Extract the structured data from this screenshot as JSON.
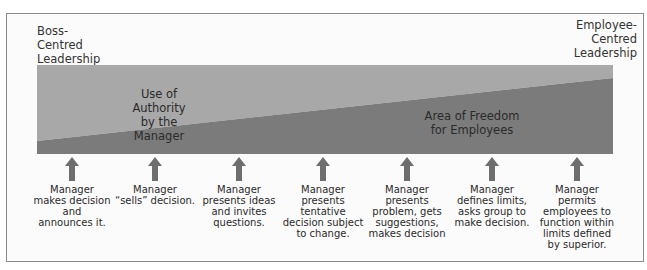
{
  "diagram": {
    "type": "leadership-continuum",
    "left_end_label": "Boss-\nCentred\nLeadership",
    "left_end_lines": [
      "Boss-",
      "Centred",
      "Leadership"
    ],
    "right_end_lines": [
      "Employee-",
      "Centred",
      "Leadership"
    ],
    "regions": {
      "authority": {
        "lines": [
          "Use of Authority",
          "by the Manager"
        ],
        "color": "#a8a8a8"
      },
      "freedom": {
        "lines": [
          "Area of Freedom",
          "for Employees"
        ],
        "color": "#7b7b7b"
      }
    },
    "arrow_color": "#6e6e6e",
    "steps": [
      {
        "lines": [
          "Manager",
          "makes decision",
          "and",
          "announces it."
        ]
      },
      {
        "lines": [
          "Manager",
          "“sells” decision."
        ]
      },
      {
        "lines": [
          "Manager",
          "presents ideas",
          "and invites",
          "questions."
        ]
      },
      {
        "lines": [
          "Manager",
          "presents",
          "tentative",
          "decision subject",
          "to change."
        ]
      },
      {
        "lines": [
          "Manager",
          "presents",
          "problem, gets",
          "suggestions,",
          "makes decision"
        ]
      },
      {
        "lines": [
          "Manager",
          "defines limits,",
          "asks group to",
          "make decision."
        ]
      },
      {
        "lines": [
          "Manager",
          "permits",
          "employees to",
          "function within",
          "limits defined",
          "by superior."
        ]
      }
    ]
  }
}
